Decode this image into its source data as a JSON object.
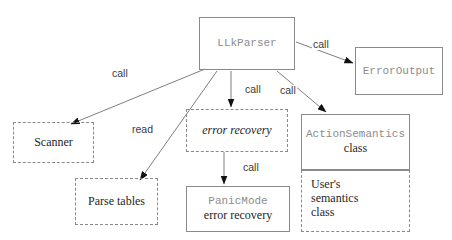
{
  "diagram": {
    "canvas": {
      "width": 452,
      "height": 240,
      "background": "#ffffff"
    },
    "colors": {
      "border": "#8a8a8a",
      "edge": "#6f6f6f",
      "mono_text": "#8d8d8d",
      "serif_text": "#262626",
      "label_text": "#3a3a3a"
    },
    "nodes": [
      {
        "id": "llkparser",
        "name": "LLkParser",
        "style": "solid",
        "line1": "LLkParser",
        "line1_font": "mono",
        "x": 199,
        "y": 17,
        "w": 96,
        "h": 53
      },
      {
        "id": "erroroutput",
        "name": "ErrorOutput",
        "style": "solid",
        "line1": "ErrorOutput",
        "line1_font": "mono",
        "x": 355,
        "y": 47,
        "w": 88,
        "h": 48
      },
      {
        "id": "scanner",
        "name": "Scanner",
        "style": "dashed",
        "line1": "Scanner",
        "line1_font": "serif",
        "x": 13,
        "y": 122,
        "w": 81,
        "h": 41
      },
      {
        "id": "parsetables",
        "name": "Parse tables",
        "style": "dashed",
        "line1": "Parse tables",
        "line1_font": "serif",
        "x": 75,
        "y": 178,
        "w": 83,
        "h": 47
      },
      {
        "id": "errorrecovery",
        "name": "error recovery",
        "style": "dashed",
        "line1": "error recovery",
        "line1_font": "serif-italic",
        "x": 186,
        "y": 109,
        "w": 102,
        "h": 43
      },
      {
        "id": "panicmode",
        "name": "PanicMode error recovery",
        "style": "solid",
        "line1": "PanicMode",
        "line1_font": "mono",
        "line2": "error recovery",
        "line2_font": "serif",
        "x": 186,
        "y": 186,
        "w": 104,
        "h": 46
      },
      {
        "id": "actionsemantics",
        "name": "ActionSemantics class",
        "style": "solid",
        "line1": "ActionSemantics",
        "line1_font": "mono",
        "line2": "class",
        "line2_font": "serif",
        "x": 301,
        "y": 114,
        "w": 109,
        "h": 56
      },
      {
        "id": "usersemantics",
        "name": "User's semantics class",
        "style": "dashed-no-top",
        "line1": "User's",
        "line2": "semantics",
        "line3": "class",
        "line1_font": "serif",
        "x": 301,
        "y": 170,
        "w": 109,
        "h": 62
      }
    ],
    "edges": [
      {
        "id": "e_scanner",
        "from": "llkparser",
        "to": "scanner",
        "label": "call",
        "label_x": 111,
        "label_y": 68,
        "x1": 205,
        "y1": 69,
        "x2": 71,
        "y2": 124
      },
      {
        "id": "e_parse",
        "from": "llkparser",
        "to": "parsetables",
        "label": "read",
        "label_x": 131,
        "label_y": 124,
        "x1": 217,
        "y1": 71,
        "x2": 140,
        "y2": 180
      },
      {
        "id": "e_errorrec",
        "from": "llkparser",
        "to": "errorrecovery",
        "label": "call",
        "label_x": 244,
        "label_y": 84,
        "x1": 231,
        "y1": 71,
        "x2": 231,
        "y2": 107
      },
      {
        "id": "e_actionsem",
        "from": "llkparser",
        "to": "actionsemantics",
        "label": "call",
        "label_x": 279,
        "label_y": 85,
        "x1": 277,
        "y1": 71,
        "x2": 326,
        "y2": 112
      },
      {
        "id": "e_erroroutput",
        "from": "llkparser",
        "to": "erroroutput",
        "label": "call",
        "label_x": 312,
        "label_y": 39,
        "x1": 296,
        "y1": 42,
        "x2": 353,
        "y2": 63
      },
      {
        "id": "e_panicmode",
        "from": "errorrecovery",
        "to": "panicmode",
        "label": "call",
        "label_x": 242,
        "label_y": 162,
        "x1": 224,
        "y1": 152,
        "x2": 224,
        "y2": 184
      }
    ]
  }
}
